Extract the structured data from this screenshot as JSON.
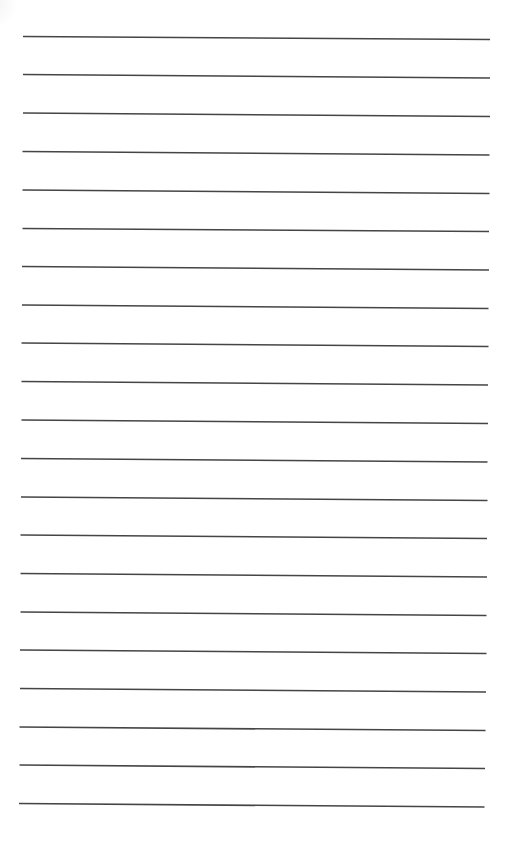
{
  "document": {
    "type": "lined-paper",
    "background_color": "#ffffff",
    "line_color": "#454545",
    "line_count": 21,
    "line_thickness": 1.7,
    "lines": [
      {
        "x1": 23,
        "y1": 36.5,
        "x2": 490,
        "y2": 39.5
      },
      {
        "x1": 23,
        "y1": 74.5,
        "x2": 490,
        "y2": 78
      },
      {
        "x1": 23,
        "y1": 113,
        "x2": 490,
        "y2": 116.5
      },
      {
        "x1": 22.5,
        "y1": 151.5,
        "x2": 489.5,
        "y2": 155
      },
      {
        "x1": 22.5,
        "y1": 190,
        "x2": 489.5,
        "y2": 193.5
      },
      {
        "x1": 22.5,
        "y1": 228.5,
        "x2": 489,
        "y2": 231.5
      },
      {
        "x1": 22,
        "y1": 266.5,
        "x2": 489,
        "y2": 270
      },
      {
        "x1": 22,
        "y1": 305,
        "x2": 488.5,
        "y2": 308.5
      },
      {
        "x1": 21.5,
        "y1": 343,
        "x2": 488.5,
        "y2": 346.5
      },
      {
        "x1": 21.5,
        "y1": 381.5,
        "x2": 488,
        "y2": 385
      },
      {
        "x1": 21.5,
        "y1": 420,
        "x2": 488,
        "y2": 423.5
      },
      {
        "x1": 21,
        "y1": 458.5,
        "x2": 487.5,
        "y2": 462
      },
      {
        "x1": 21,
        "y1": 497,
        "x2": 487.5,
        "y2": 500.5
      },
      {
        "x1": 20.5,
        "y1": 535,
        "x2": 487,
        "y2": 538.5
      },
      {
        "x1": 20.5,
        "y1": 573.5,
        "x2": 487,
        "y2": 577
      },
      {
        "x1": 20.5,
        "y1": 612,
        "x2": 486.5,
        "y2": 615.5
      },
      {
        "x1": 20,
        "y1": 650,
        "x2": 486.5,
        "y2": 653.5
      },
      {
        "x1": 20,
        "y1": 688.5,
        "x2": 486,
        "y2": 692
      },
      {
        "x1": 19.5,
        "y1": 727,
        "x2": 485.5,
        "y2": 730.5
      },
      {
        "x1": 19.5,
        "y1": 765,
        "x2": 485,
        "y2": 768.5
      },
      {
        "x1": 19,
        "y1": 803.5,
        "x2": 484.5,
        "y2": 807
      }
    ]
  }
}
